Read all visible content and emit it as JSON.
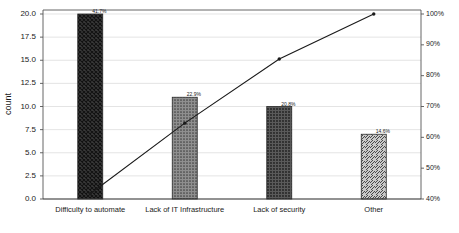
{
  "chart_data": {
    "type": "bar",
    "title": "",
    "subtitle": "",
    "xlabel": "",
    "ylabel": "count",
    "y2label": "cumulative percentage",
    "categories": [
      "Difficulty to automate",
      "Lack of IT Infrastructure",
      "Lack of security",
      "Other"
    ],
    "values": [
      20,
      11,
      10,
      7
    ],
    "total": 48,
    "bar_labels": [
      "41.7%",
      "22.9%",
      "20.8%",
      "14.6%"
    ],
    "bar_percents": [
      41.7,
      22.9,
      20.8,
      14.6
    ],
    "cumulative_percent": [
      41.7,
      64.6,
      85.4,
      100.0
    ],
    "ylim": [
      0,
      20
    ],
    "y2lim": [
      40,
      100
    ],
    "yticks": [
      "0.0",
      "2.5",
      "5.0",
      "7.5",
      "10.0",
      "12.5",
      "15.0",
      "17.5",
      "20.0"
    ],
    "ytick_values": [
      0,
      2.5,
      5,
      7.5,
      10,
      12.5,
      15,
      17.5,
      20
    ],
    "y2ticks": [
      "40%",
      "50%",
      "60%",
      "70%",
      "80%",
      "90%",
      "100%"
    ],
    "y2tick_values": [
      40,
      50,
      60,
      70,
      80,
      90,
      100
    ],
    "grid": true,
    "legend": "none",
    "series": [
      {
        "name": "count",
        "type": "bar",
        "values": [
          20,
          11,
          10,
          7
        ]
      },
      {
        "name": "cumulative percentage",
        "type": "line",
        "values": [
          41.7,
          64.6,
          85.4,
          100.0
        ]
      }
    ],
    "bar_patterns": [
      "crosshatch",
      "dots-light",
      "dots-dark",
      "diagonal-hatch"
    ],
    "colors": {
      "bar_dark": "#3a3a3a",
      "bar_mid": "#6e6e6e",
      "bar_light": "#b8b8b8",
      "line": "#1a1a1a",
      "grid": "#d9d9d9",
      "axis": "#555555",
      "text": "#1a1a1a"
    }
  }
}
